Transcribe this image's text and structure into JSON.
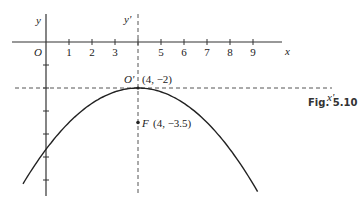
{
  "figure": {
    "caption": "Fig. 5.10",
    "axes": {
      "x_label": "x",
      "y_label": "y",
      "origin_label": "O",
      "x_ticks": [
        "1",
        "2",
        "3",
        "4",
        "5",
        "6",
        "7",
        "8",
        "9"
      ],
      "x_tick_labels_shown": [
        "1",
        "2",
        "3",
        "5",
        "6",
        "7",
        "8",
        "9"
      ],
      "y_ticks": [
        -1,
        -2,
        -3,
        -4,
        -5,
        -6
      ]
    },
    "translated_axes": {
      "x_label": "x'",
      "y_label": "y'",
      "origin_label": "O'",
      "origin": [
        4,
        -2
      ]
    },
    "vertex": {
      "x": 4,
      "y": -2,
      "label": "(4, −2)"
    },
    "focus": {
      "x": 4,
      "y": -3.5,
      "name": "F",
      "label": "(4, −3.5)"
    },
    "curve": {
      "type": "parabola",
      "opens": "down",
      "vertex": [
        4,
        -2
      ],
      "focus": [
        4,
        -3.5
      ],
      "x_range": [
        -1,
        9.2
      ]
    }
  }
}
